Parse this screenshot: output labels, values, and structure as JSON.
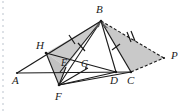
{
  "figure": {
    "background_color": "#ffffff",
    "stroke_color": "#1a1a1a",
    "shade_fill": "#c9c9c9",
    "shade_fill_light": "#d6d6d6",
    "binding_dots_color": "#bfc6cf",
    "vertices": [
      {
        "name": "A",
        "label": "A",
        "x": 17,
        "y": 73,
        "label_x": 12,
        "label_y": 84
      },
      {
        "name": "B",
        "label": "B",
        "x": 101,
        "y": 21,
        "label_x": 96,
        "label_y": 13
      },
      {
        "name": "C",
        "label": "C",
        "x": 131,
        "y": 72,
        "label_x": 127,
        "label_y": 84
      },
      {
        "name": "D",
        "label": "D",
        "x": 116,
        "y": 72,
        "label_x": 110,
        "label_y": 84
      },
      {
        "name": "E",
        "label": "E",
        "x": 66,
        "y": 67,
        "label_x": 61,
        "label_y": 66
      },
      {
        "name": "F",
        "label": "F",
        "x": 59,
        "y": 85,
        "label_x": 55,
        "label_y": 100
      },
      {
        "name": "G",
        "label": "G",
        "x": 86,
        "y": 68,
        "label_x": 81,
        "label_y": 67
      },
      {
        "name": "H",
        "label": "H",
        "x": 46,
        "y": 53,
        "label_x": 36,
        "label_y": 49
      },
      {
        "name": "P",
        "label": "P",
        "x": 164,
        "y": 58,
        "label_x": 171,
        "label_y": 59
      }
    ],
    "shaded_regions": [
      {
        "name": "triangle-H-B-E",
        "points": "46,53 101,21 66,67",
        "fill": "#cccccc"
      },
      {
        "name": "triangle-H-E-F",
        "points": "46,53 66,67 59,85",
        "fill": "#c4c4c4"
      },
      {
        "name": "triangle-B-C-P",
        "points": "101,21 131,72 164,58",
        "fill": "#c9c9c9"
      }
    ],
    "solid_segments": [
      {
        "name": "segment-A-B",
        "from": "A",
        "to": "B"
      },
      {
        "name": "segment-A-C",
        "from": "A",
        "to": "C"
      },
      {
        "name": "segment-B-C",
        "from": "B",
        "to": "C"
      },
      {
        "name": "segment-B-D",
        "from": "B",
        "to": "D"
      },
      {
        "name": "segment-B-F",
        "from": "B",
        "to": "F"
      },
      {
        "name": "segment-B-E",
        "from": "B",
        "to": "E"
      },
      {
        "name": "segment-H-D",
        "from": "H",
        "to": "D"
      },
      {
        "name": "segment-H-F",
        "from": "H",
        "to": "F"
      },
      {
        "name": "segment-E-F",
        "from": "E",
        "to": "F"
      },
      {
        "name": "segment-F-D",
        "from": "F",
        "to": "D"
      },
      {
        "name": "segment-F-G",
        "from": "F",
        "to": "G"
      },
      {
        "name": "segment-F-C",
        "from": "F",
        "to": "C"
      }
    ],
    "dashed_segments": [
      {
        "name": "segment-B-P",
        "from": "B",
        "to": "P"
      },
      {
        "name": "segment-C-P",
        "from": "C",
        "to": "P"
      }
    ],
    "tick_marks": [
      {
        "name": "tick-on-AB-upper",
        "count": 1,
        "note": "single tick between H and B"
      },
      {
        "name": "tick-on-BE",
        "count": 1,
        "note": "single tick on B-E cevian"
      },
      {
        "name": "tick-on-BC",
        "count": 1,
        "note": "single tick on B-C"
      },
      {
        "name": "tick-on-BP",
        "count": 2,
        "note": "double tick on dashed B-P"
      }
    ],
    "angle_marks": [
      {
        "name": "angle-mark-B-left",
        "at": "B"
      },
      {
        "name": "angle-mark-B-right",
        "at": "B"
      }
    ]
  }
}
